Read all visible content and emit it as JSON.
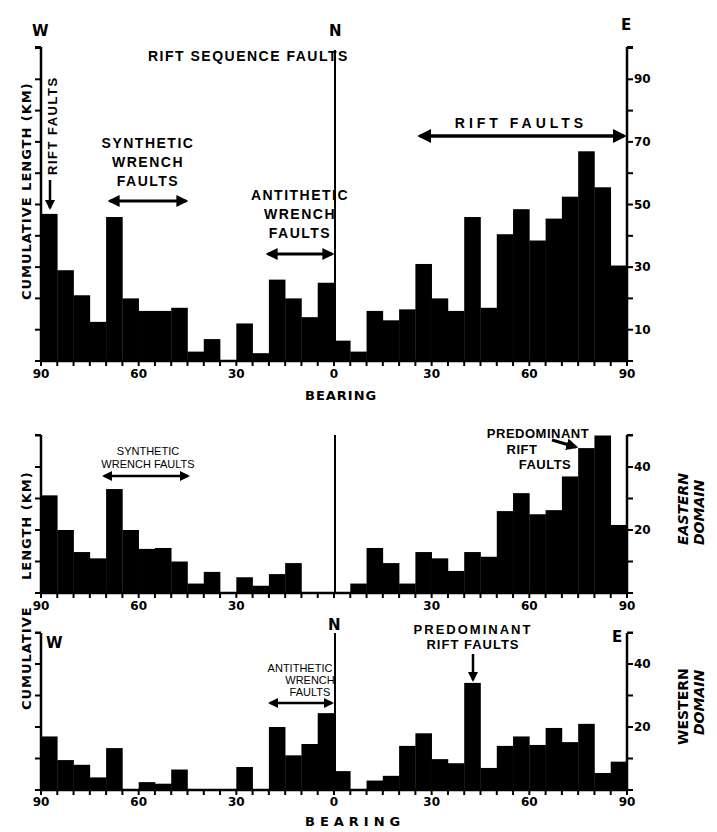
{
  "figure": {
    "corner_labels": {
      "west": "W",
      "north": "N",
      "east": "E"
    },
    "ylabel": "CUMULATIVE LENGTH (KM)",
    "xlabel": "BEARING"
  },
  "chart_data": [
    {
      "type": "bar",
      "id": "rift-sequence",
      "title": "RIFT SEQUENCE FAULTS",
      "xlabel": "BEARING",
      "ylabel": "CUMULATIVE LENGTH (KM)",
      "x_tick_labels": [
        "90",
        "60",
        "30",
        "0",
        "30",
        "60",
        "90"
      ],
      "y_tick_labels": [
        "10",
        "30",
        "50",
        "70",
        "90"
      ],
      "ylim": [
        0,
        100
      ],
      "bin_width_deg": 5,
      "categories": [
        "W90-85",
        "W85-80",
        "W80-75",
        "W75-70",
        "W70-65",
        "W65-60",
        "W60-55",
        "W55-50",
        "W50-45",
        "W45-40",
        "W40-35",
        "W35-30",
        "W30-25",
        "W25-20",
        "W20-15",
        "W15-10",
        "W10-5",
        "W5-0",
        "E0-5",
        "E5-10",
        "E10-15",
        "E15-20",
        "E20-25",
        "E25-30",
        "E30-35",
        "E35-40",
        "E40-45",
        "E45-50",
        "E50-55",
        "E55-60",
        "E60-65",
        "E65-70",
        "E70-75",
        "E75-80",
        "E80-85",
        "E85-90"
      ],
      "values": [
        47,
        29,
        21,
        12.5,
        46,
        20,
        16,
        16,
        17,
        3,
        7,
        0,
        12,
        2.5,
        26,
        20,
        14,
        25,
        6.5,
        3,
        16,
        13,
        16.5,
        31,
        20,
        16,
        46,
        17,
        40.5,
        48.5,
        38.5,
        45.5,
        52.5,
        67,
        55.5,
        30.5
      ],
      "annotations": [
        {
          "text": "RIFT FAULTS",
          "kind": "arrow-down",
          "at": "W88"
        },
        {
          "text": "SYNTHETIC WRENCH FAULTS",
          "kind": "double-arrow",
          "range": [
            "W70",
            "W45"
          ]
        },
        {
          "text": "ANTITHETIC WRENCH FAULTS",
          "kind": "double-arrow",
          "range": [
            "W20",
            "N0"
          ]
        },
        {
          "text": "RIFT FAULTS",
          "kind": "double-arrow",
          "range": [
            "E25",
            "E90"
          ]
        }
      ],
      "grid": false
    },
    {
      "type": "bar",
      "id": "eastern-domain",
      "title": "EASTERN DOMAIN",
      "xlabel": "",
      "ylabel": "LENGTH (KM)",
      "x_tick_labels": [
        "90",
        "60",
        "30",
        "30",
        "60",
        "90"
      ],
      "y_tick_labels": [
        "20",
        "40"
      ],
      "ylim": [
        0,
        50
      ],
      "bin_width_deg": 5,
      "categories": [
        "W90-85",
        "W85-80",
        "W80-75",
        "W75-70",
        "W70-65",
        "W65-60",
        "W60-55",
        "W55-50",
        "W50-45",
        "W45-40",
        "W40-35",
        "W35-30",
        "W30-25",
        "W25-20",
        "W20-15",
        "W15-10",
        "W10-5",
        "W5-0",
        "E0-5",
        "E5-10",
        "E10-15",
        "E15-20",
        "E20-25",
        "E25-30",
        "E30-35",
        "E35-40",
        "E40-45",
        "E45-50",
        "E50-55",
        "E55-60",
        "E60-65",
        "E65-70",
        "E70-75",
        "E75-80",
        "E80-85",
        "E85-90"
      ],
      "values": [
        31,
        20,
        13,
        11,
        33,
        20,
        14,
        14.3,
        10,
        3,
        6.7,
        0,
        5,
        2.3,
        6,
        9.5,
        0,
        0,
        0,
        3,
        14.3,
        9.5,
        3,
        13,
        11,
        7,
        13,
        11.5,
        26,
        31.7,
        25,
        26.3,
        37,
        46,
        50,
        21.6
      ],
      "annotations": [
        {
          "text": "SYNTHETIC WRENCH FAULTS",
          "kind": "double-arrow",
          "range": [
            "W72",
            "W47"
          ]
        },
        {
          "text": "PREDOMINANT RIFT FAULTS",
          "kind": "arrow",
          "at": "E78"
        }
      ],
      "grid": false
    },
    {
      "type": "bar",
      "id": "western-domain",
      "title": "WESTERN DOMAIN",
      "xlabel": "BEARING",
      "ylabel": "CUMULATIVE",
      "x_tick_labels": [
        "90",
        "60",
        "30",
        "0",
        "30",
        "60",
        "90"
      ],
      "y_tick_labels": [
        "20",
        "40"
      ],
      "ylim": [
        0,
        50
      ],
      "bin_width_deg": 5,
      "categories": [
        "W90-85",
        "W85-80",
        "W80-75",
        "W75-70",
        "W70-65",
        "W65-60",
        "W60-55",
        "W55-50",
        "W50-45",
        "W45-40",
        "W40-35",
        "W35-30",
        "W30-25",
        "W25-20",
        "W20-15",
        "W15-10",
        "W10-5",
        "W5-0",
        "E0-5",
        "E5-10",
        "E10-15",
        "E15-20",
        "E20-25",
        "E25-30",
        "E30-35",
        "E35-40",
        "E40-45",
        "E45-50",
        "E50-55",
        "E55-60",
        "E60-65",
        "E65-70",
        "E70-75",
        "E75-80",
        "E80-85",
        "E85-90"
      ],
      "values": [
        17,
        9.5,
        8,
        4,
        13.3,
        0,
        2.5,
        2,
        6.5,
        0,
        0,
        0,
        7.3,
        0,
        20,
        11,
        14.6,
        24.4,
        6,
        0,
        3,
        4.5,
        14,
        18,
        9.8,
        8.5,
        34,
        7,
        14,
        17,
        14.3,
        19.7,
        15.2,
        21,
        5.4,
        9
      ],
      "annotations": [
        {
          "text": "ANTITHETIC WRENCH FAULTS",
          "kind": "double-arrow",
          "range": [
            "W20",
            "N0"
          ]
        },
        {
          "text": "PREDOMINANT RIFT FAULTS",
          "kind": "arrow-down",
          "at": "E43"
        }
      ],
      "grid": false
    }
  ],
  "labels": {
    "top_title": "RIFT SEQUENCE FAULTS",
    "rift_faults_vertical": "RIFT FAULTS",
    "synthetic_l1": "SYNTHETIC",
    "synthetic_l2": "WRENCH",
    "synthetic_l3": "FAULTS",
    "antithetic_l1": "ANTITHETIC",
    "antithetic_l2": "WRENCH",
    "antithetic_l3": "FAULTS",
    "rift_faults_top": "RIFT FAULTS",
    "mid_synthetic_l1": "SYNTHETIC",
    "mid_synthetic_l2": "WRENCH FAULTS",
    "mid_predominant_l1": "PREDOMINANT",
    "mid_predominant_l2": "RIFT",
    "mid_predominant_l3": "FAULTS",
    "bot_predominant_l1": "PREDOMINANT",
    "bot_predominant_l2": "RIFT FAULTS",
    "eastern_l1": "EASTERN",
    "eastern_l2": "DOMAIN",
    "western_l1": "WESTERN",
    "western_l2": "DOMAIN",
    "ylabel_top": "CUMULATIVE LENGTH (KM)",
    "ylabel_mid": "LENGTH (KM)",
    "ylabel_bot": "CUMULATIVE"
  }
}
